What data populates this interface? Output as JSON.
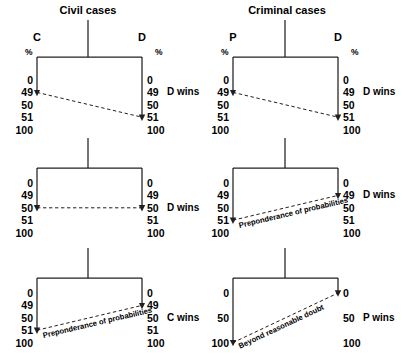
{
  "diagram": {
    "columns": [
      {
        "title": "Civil cases",
        "left_party": "C",
        "right_party": "D",
        "percent_symbol": "%"
      },
      {
        "title": "Criminal cases",
        "left_party": "P",
        "right_party": "D",
        "percent_symbol": "%"
      }
    ],
    "panels": [
      {
        "id": "civil-top",
        "column": "Civil cases",
        "scale_left": [
          "0",
          "49",
          "50",
          "51",
          "100"
        ],
        "scale_right": [
          "0",
          "49",
          "50",
          "51",
          "100"
        ],
        "left_arrow_value": "49",
        "right_arrow_value": "51",
        "dashed_label": "",
        "outcome": "D wins",
        "outcome_row": "49"
      },
      {
        "id": "criminal-top",
        "column": "Criminal cases",
        "scale_left": [
          "0",
          "49",
          "50",
          "51",
          "100"
        ],
        "scale_right": [
          "0",
          "49",
          "50",
          "51",
          "100"
        ],
        "left_arrow_value": "49",
        "right_arrow_value": "51",
        "dashed_label": "",
        "outcome": "D wins",
        "outcome_row": "49"
      },
      {
        "id": "civil-middle",
        "column": "Civil cases",
        "scale_left": [
          "0",
          "49",
          "50",
          "51",
          "100"
        ],
        "scale_right": [
          "0",
          "49",
          "50",
          "51",
          "100"
        ],
        "left_arrow_value": "50",
        "right_arrow_value": "50",
        "dashed_label": "",
        "outcome": "D wins",
        "outcome_row": "50"
      },
      {
        "id": "criminal-middle",
        "column": "Criminal cases",
        "scale_left": [
          "0",
          "49",
          "50",
          "51",
          "100"
        ],
        "scale_right": [
          "0",
          "49",
          "50",
          "51",
          "100"
        ],
        "left_arrow_value": "51",
        "right_arrow_value": "49",
        "dashed_label": "Preponderance of probabilities",
        "outcome": "D wins",
        "outcome_row": "49"
      },
      {
        "id": "civil-bottom",
        "column": "Civil cases",
        "scale_left": [
          "0",
          "49",
          "50",
          "51",
          "100"
        ],
        "scale_right": [
          "0",
          "49",
          "50",
          "51",
          "100"
        ],
        "left_arrow_value": "51",
        "right_arrow_value": "49",
        "dashed_label": "Preponderance of probabilities",
        "outcome": "C wins",
        "outcome_row": "50"
      },
      {
        "id": "criminal-bottom",
        "column": "Criminal cases",
        "scale_left": [
          "0",
          "50",
          "100"
        ],
        "scale_right": [
          "0",
          "50",
          "100"
        ],
        "left_arrow_value": "100",
        "right_arrow_value": "0",
        "dashed_label": "Beyond reasonable doubt",
        "outcome": "P wins",
        "outcome_row": "50"
      }
    ],
    "colors": {
      "line": "#231f20",
      "text": "#000000",
      "background": "#ffffff"
    }
  }
}
